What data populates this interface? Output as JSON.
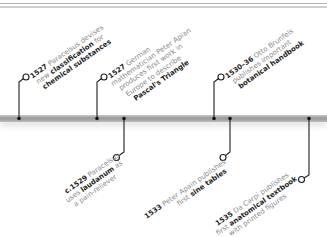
{
  "timeline": {
    "bar_color": "#a3a3a3",
    "events": [
      {
        "id": "e1527a",
        "year": "1527",
        "lines": [
          {
            "plain": " Paracelsus devises",
            "bold": ""
          },
          {
            "plain": "new ",
            "bold": "classification",
            "after": " for"
          },
          {
            "plain": "",
            "bold": "chemical substances"
          }
        ],
        "position": "above"
      },
      {
        "id": "e1527b",
        "year": "1527",
        "lines": [
          {
            "plain": " German",
            "bold": ""
          },
          {
            "plain": "mathematician Peter Apian",
            "bold": ""
          },
          {
            "plain": "produces first work in",
            "bold": ""
          },
          {
            "plain": "Europe to describe",
            "bold": ""
          },
          {
            "plain": "",
            "bold": "Pascal's Triangle"
          }
        ],
        "position": "above"
      },
      {
        "id": "e1529",
        "year": "c.1529",
        "lines": [
          {
            "plain": " Paracelsus",
            "bold": ""
          },
          {
            "plain": "uses ",
            "bold": "laudanum",
            "after": " as"
          },
          {
            "plain": "a pain-reliever",
            "bold": ""
          }
        ],
        "position": "below"
      },
      {
        "id": "e1530",
        "year": "1530–36",
        "lines": [
          {
            "plain": " Otto Brunfels",
            "bold": ""
          },
          {
            "plain": "publishes important",
            "bold": ""
          },
          {
            "plain": "",
            "bold": "botanical handbook"
          }
        ],
        "position": "above"
      },
      {
        "id": "e1533",
        "year": "1533",
        "lines": [
          {
            "plain": " Peter Apain publishes",
            "bold": ""
          },
          {
            "plain": "first ",
            "bold": "sine tables"
          }
        ],
        "position": "below"
      },
      {
        "id": "e1535",
        "year": "1535",
        "lines": [
          {
            "plain": " Da Carpi publishes",
            "bold": ""
          },
          {
            "plain": "first ",
            "bold": "anatomical textbook"
          },
          {
            "plain": "with printed figures",
            "bold": ""
          }
        ],
        "position": "below"
      }
    ]
  }
}
